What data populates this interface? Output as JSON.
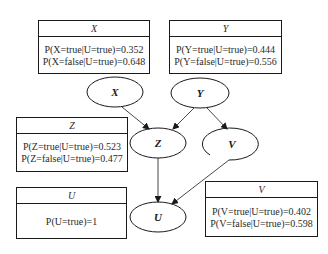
{
  "diagram": {
    "type": "bayesian-network",
    "nodes": [
      {
        "id": "X",
        "label": "X",
        "cx": 115,
        "cy": 92
      },
      {
        "id": "Y",
        "label": "Y",
        "cx": 200,
        "cy": 93
      },
      {
        "id": "Z",
        "label": "Z",
        "cx": 158,
        "cy": 143
      },
      {
        "id": "V",
        "label": "V",
        "cx": 232,
        "cy": 144
      },
      {
        "id": "U",
        "label": "U",
        "cx": 158,
        "cy": 217
      }
    ],
    "edges": [
      {
        "from": "X",
        "to": "Z"
      },
      {
        "from": "Y",
        "to": "Z"
      },
      {
        "from": "Y",
        "to": "V"
      },
      {
        "from": "Z",
        "to": "U"
      },
      {
        "from": "V",
        "to": "U"
      }
    ]
  },
  "tables": {
    "X": {
      "title": "X",
      "rows": [
        "P(X=true|U=true)=0.352",
        "P(X=false|U=true)=0.648"
      ]
    },
    "Y": {
      "title": "Y",
      "rows": [
        "P(Y=true|U=true)=0.444",
        "P(Y=false|U=true)=0.556"
      ]
    },
    "Z": {
      "title": "Z",
      "rows": [
        "P(Z=true|U=true)=0.523",
        "P(Z=false|U=true)=0.477"
      ]
    },
    "U": {
      "title": "U",
      "rows": [
        "P(U=true)=1"
      ]
    },
    "V": {
      "title": "V",
      "rows": [
        "P(V=true|U=true)=0.402",
        "P(V=false|U=true)=0.598"
      ]
    }
  },
  "colors": {
    "stroke": "#1a1a1a",
    "text": "#2a2a2a",
    "background": "#ffffff"
  }
}
